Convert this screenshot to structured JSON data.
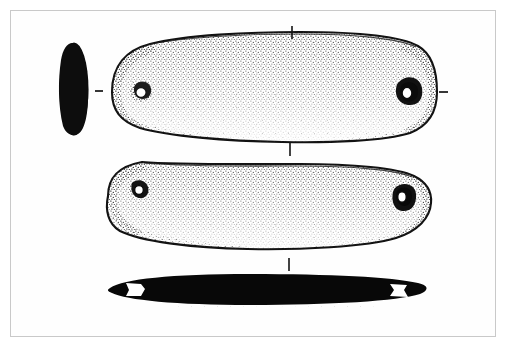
{
  "plate": {
    "kind": "archaeological-line-drawing",
    "caption": "",
    "background_color": "#ffffff",
    "frame_color": "#c9c9c9",
    "ink_color": "#111111",
    "stipple_color": "#2a2a2a",
    "width": 507,
    "height": 353
  },
  "artifact": {
    "description": "Elongated lenticular object with two perforations, shown in four orthographic views",
    "perforation_count": 2
  },
  "views": [
    {
      "id": "section-view",
      "name": "cross-section-end-view",
      "label": "",
      "fill": "solid-black",
      "shape": "vertical-ellipse",
      "center": {
        "x": 74,
        "y": 89
      },
      "radius": {
        "x": 15,
        "y": 47
      }
    },
    {
      "id": "obverse-view",
      "name": "obverse-face-view",
      "label": "",
      "fill": "outline-with-stipple",
      "shape": "elongated-lozenge",
      "bounds": {
        "x": 108,
        "y": 30,
        "width": 330,
        "height": 110
      },
      "perforations": [
        {
          "name": "perforation-left",
          "cx": 141,
          "cy": 92,
          "rx": 7.5,
          "ry": 7.5,
          "shading": "light-stipple-halo"
        },
        {
          "name": "perforation-right",
          "cx": 408,
          "cy": 92,
          "rx": 7.5,
          "ry": 7.5,
          "shading": "heavy-crescent-shadow"
        }
      ]
    },
    {
      "id": "reverse-view",
      "name": "reverse-face-view",
      "label": "",
      "fill": "outline-with-stipple",
      "shape": "elongated-lozenge",
      "bounds": {
        "x": 104,
        "y": 162,
        "width": 330,
        "height": 95
      },
      "perforations": [
        {
          "name": "perforation-left",
          "cx": 139,
          "cy": 189,
          "rx": 6.5,
          "ry": 6.5,
          "shading": "dark-ring"
        },
        {
          "name": "perforation-right",
          "cx": 404,
          "cy": 196,
          "rx": 6.5,
          "ry": 6.5,
          "shading": "heavy-crescent-shadow"
        }
      ]
    },
    {
      "id": "edge-profile-view",
      "name": "edge-profile-silhouette",
      "label": "",
      "fill": "solid-black",
      "shape": "long-thin-lens",
      "bounds": {
        "x": 108,
        "y": 275,
        "width": 320,
        "height": 28
      },
      "notches": [
        {
          "name": "notch-left",
          "cx": 136,
          "cy": 289,
          "fill": "#ffffff"
        },
        {
          "name": "notch-right",
          "cx": 399,
          "cy": 289,
          "fill": "#ffffff"
        }
      ]
    }
  ],
  "registration_marks": [
    {
      "name": "tick-top-center",
      "orientation": "vertical",
      "x": 292,
      "y": 26,
      "length": 13
    },
    {
      "name": "tick-mid-center",
      "orientation": "vertical",
      "x": 290,
      "y": 142,
      "length": 14
    },
    {
      "name": "tick-lower-center",
      "orientation": "vertical",
      "x": 289,
      "y": 258,
      "length": 13
    },
    {
      "name": "tick-left-axis",
      "orientation": "horizontal",
      "x": 95,
      "y": 91,
      "length": 8
    },
    {
      "name": "tick-right-axis",
      "orientation": "horizontal",
      "x": 439,
      "y": 92,
      "length": 9
    }
  ]
}
